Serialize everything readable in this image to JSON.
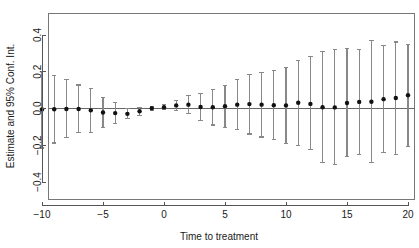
{
  "chart_data": {
    "type": "scatter",
    "title": "",
    "subtitle": "",
    "xlabel": "Time to treatment",
    "ylabel": "Estimate and 95% Conf. Int.",
    "xlim": [
      -10.8,
      20.6
    ],
    "ylim": [
      -0.56,
      0.5
    ],
    "xticks": [
      -10,
      -5,
      0,
      5,
      10,
      15,
      20
    ],
    "xticklabels": [
      "−10",
      "−5",
      "0",
      "5",
      "10",
      "15",
      "20"
    ],
    "yticks": [
      -0.4,
      -0.2,
      0.0,
      0.2,
      0.4
    ],
    "yticklabels": [
      "−0.4",
      "−0.2",
      "0.0",
      "0.2",
      "0.4"
    ],
    "grid": false,
    "legend": null,
    "reference_line_y": 0.0,
    "marker": "filled-circle",
    "error_bar_style": "capped-vertical-whisker",
    "colors": {
      "point": "#111111",
      "whisker": "#888888",
      "zero_line": "#666666",
      "axis": "#555555",
      "box": "#777777",
      "background": "#ffffff",
      "text": "#1a1a1a"
    },
    "x": [
      -10,
      -9,
      -8,
      -7,
      -6,
      -5,
      -4,
      -3,
      -2,
      -1,
      0,
      1,
      2,
      3,
      4,
      5,
      6,
      7,
      8,
      9,
      10,
      11,
      12,
      13,
      14,
      15,
      16,
      17,
      18,
      19,
      20
    ],
    "estimate": [
      -0.005,
      -0.004,
      -0.003,
      -0.003,
      -0.01,
      -0.022,
      -0.025,
      -0.029,
      -0.015,
      0.001,
      0.007,
      0.017,
      0.021,
      0.008,
      0.007,
      0.012,
      0.021,
      0.024,
      0.021,
      0.018,
      0.017,
      0.031,
      0.025,
      0.007,
      0.006,
      0.03,
      0.036,
      0.037,
      0.051,
      0.057,
      0.072
    ],
    "ci_low": [
      -0.215,
      -0.188,
      -0.16,
      -0.132,
      -0.13,
      -0.105,
      -0.082,
      -0.052,
      -0.038,
      -0.012,
      -0.005,
      -0.01,
      -0.028,
      -0.063,
      -0.09,
      -0.103,
      -0.113,
      -0.139,
      -0.155,
      -0.17,
      -0.19,
      -0.2,
      -0.225,
      -0.295,
      -0.305,
      -0.263,
      -0.248,
      -0.292,
      -0.24,
      -0.248,
      -0.205
    ],
    "ci_high": [
      0.2,
      0.178,
      0.157,
      0.128,
      0.11,
      0.062,
      0.032,
      0.0,
      0.004,
      0.013,
      0.02,
      0.043,
      0.069,
      0.08,
      0.103,
      0.127,
      0.156,
      0.184,
      0.197,
      0.208,
      0.224,
      0.262,
      0.283,
      0.31,
      0.323,
      0.325,
      0.322,
      0.368,
      0.342,
      0.362,
      0.35
    ],
    "series": [
      {
        "name": "Estimate and 95% Conf. Int.",
        "values": [
          -0.005,
          -0.004,
          -0.003,
          -0.003,
          -0.01,
          -0.022,
          -0.025,
          -0.029,
          -0.015,
          0.001,
          0.007,
          0.017,
          0.021,
          0.008,
          0.007,
          0.012,
          0.021,
          0.024,
          0.021,
          0.018,
          0.017,
          0.031,
          0.025,
          0.007,
          0.006,
          0.03,
          0.036,
          0.037,
          0.051,
          0.057,
          0.072
        ]
      }
    ]
  },
  "figure": {
    "xlabel": "Time to treatment",
    "ylabel": "Estimate and 95% Conf. Int."
  }
}
